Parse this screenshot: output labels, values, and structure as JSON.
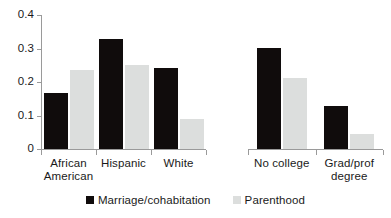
{
  "chart_data": {
    "type": "bar",
    "title": "",
    "subtitle": "",
    "xlabel": "",
    "ylabel": "",
    "ylim": [
      0,
      0.4
    ],
    "yticks": [
      "0",
      "0.1",
      "0.2",
      "0.3",
      "0.4"
    ],
    "ytick_values": [
      0,
      0.1,
      0.2,
      0.3,
      0.4
    ],
    "grid": false,
    "legend_position": "bottom",
    "categories": [
      "African American",
      "Hispanic",
      "White",
      "No college",
      "Grad/prof degree"
    ],
    "category_lines": [
      [
        "African",
        "American"
      ],
      [
        "Hispanic",
        ""
      ],
      [
        "White",
        ""
      ],
      [
        "No college",
        ""
      ],
      [
        "Grad/prof",
        "degree"
      ]
    ],
    "series": [
      {
        "name": "Marriage/cohabitation",
        "color": "#100c0c",
        "values": [
          0.167,
          0.327,
          0.243,
          0.303,
          0.127
        ]
      },
      {
        "name": "Parenthood",
        "color": "#dcdedd",
        "values": [
          0.235,
          0.251,
          0.089,
          0.212,
          0.046
        ]
      }
    ],
    "group_gap_after_index": 2,
    "axis_color": "#9a9a9a",
    "text_color": "#1a1a1a",
    "background": "#ffffff"
  },
  "legend": {
    "items": [
      {
        "label": "Marriage/cohabitation",
        "color": "#100c0c"
      },
      {
        "label": "Parenthood",
        "color": "#dcdedd"
      }
    ]
  }
}
